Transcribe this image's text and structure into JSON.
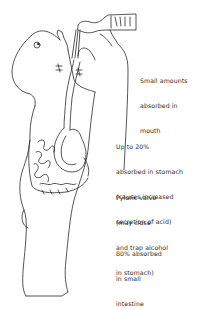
{
  "diagram": {
    "figure": "person drinking from bottle with digestive tract shown",
    "labels": [
      {
        "id": "mouth",
        "lines": [
          "Small amounts",
          "absorbed in",
          "mouth"
        ]
      },
      {
        "id": "stomach",
        "lines": [
          "Up to 20%",
          "absorbed in stomach",
          "(causes increased",
          "secretion of acid)"
        ]
      },
      {
        "id": "pyloric",
        "lines": [
          "Pyloric valve",
          "(may close",
          "and trap alcohol",
          "in stomach)"
        ]
      },
      {
        "id": "intestine",
        "lines": [
          "80% absorbed",
          "in small",
          "intestine"
        ]
      }
    ],
    "colors": {
      "line": "#2a2a2a",
      "background": "#ffffff"
    }
  }
}
